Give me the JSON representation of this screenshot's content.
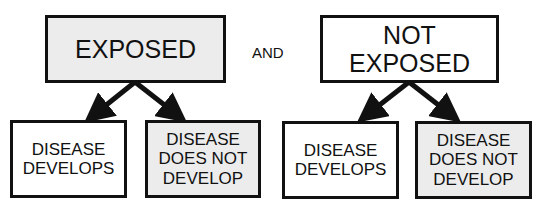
{
  "diagram": {
    "connector_label": "AND",
    "groups": [
      {
        "label": "EXPOSED",
        "outcomes": [
          "DISEASE DEVELOPS",
          "DISEASE DOES NOT DEVELOP"
        ]
      },
      {
        "label": "NOT EXPOSED",
        "outcomes": [
          "DISEASE DEVELOPS",
          "DISEASE DOES NOT DEVELOP"
        ]
      }
    ]
  },
  "colors": {
    "border": "#111111",
    "shaded_fill": "#ececec",
    "white_fill": "#ffffff"
  }
}
